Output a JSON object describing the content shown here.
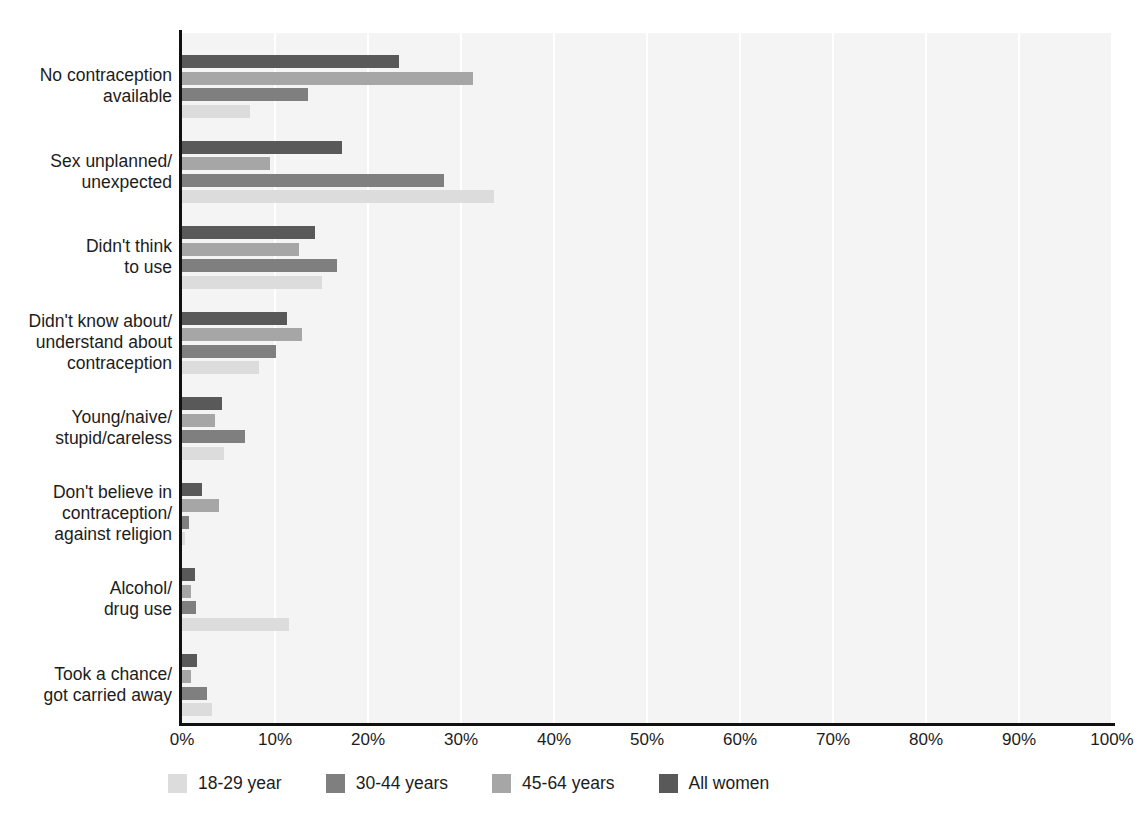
{
  "chart_data": {
    "type": "bar",
    "orientation": "horizontal",
    "title": "",
    "xlabel": "",
    "ylabel": "",
    "xlim": [
      0,
      100
    ],
    "xticks": [
      "0%",
      "10%",
      "20%",
      "30%",
      "40%",
      "50%",
      "60%",
      "70%",
      "80%",
      "90%",
      "100%"
    ],
    "xtick_values": [
      0,
      10,
      20,
      30,
      40,
      50,
      60,
      70,
      80,
      90,
      100
    ],
    "grid": true,
    "legend_position": "bottom",
    "categories": [
      "No contraception\navailable",
      "Sex unplanned/\nunexpected",
      "Didn't think\nto use",
      "Didn't know about/\nunderstand about\ncontraception",
      "Young/naive/\nstupid/careless",
      "Don't believe in\ncontraception/\nagainst religion",
      "Alcohol/\ndrug use",
      "Took a chance/\ngot carried away"
    ],
    "series": [
      {
        "name": "All women",
        "color": "#595959",
        "values": [
          23.3,
          17.2,
          14.3,
          11.3,
          4.3,
          2.2,
          1.4,
          1.6
        ]
      },
      {
        "name": "45-64 years",
        "color": "#a6a6a6",
        "values": [
          31.3,
          9.5,
          12.6,
          12.9,
          3.5,
          4.0,
          1.0,
          1.0
        ]
      },
      {
        "name": "30-44 years",
        "color": "#7f7f7f",
        "values": [
          13.5,
          28.2,
          16.7,
          10.1,
          6.8,
          0.7,
          1.5,
          2.7
        ]
      },
      {
        "name": "18-29 year",
        "color": "#dcdcdc",
        "values": [
          7.3,
          33.5,
          15.0,
          8.3,
          4.5,
          0.3,
          11.5,
          3.2
        ]
      }
    ],
    "series_draw_order": [
      "All women",
      "45-64 years",
      "30-44 years",
      "18-29 year"
    ],
    "legend": [
      {
        "label": "18-29 year",
        "color": "#dcdcdc"
      },
      {
        "label": "30-44 years",
        "color": "#7f7f7f"
      },
      {
        "label": "45-64 years",
        "color": "#a6a6a6"
      },
      {
        "label": "All women",
        "color": "#595959"
      }
    ],
    "plot_background": "#f4f4f4",
    "gridline_color": "#ffffff",
    "axis_color": "#111111"
  },
  "caption": ""
}
